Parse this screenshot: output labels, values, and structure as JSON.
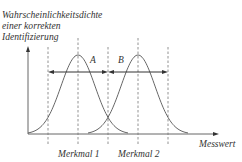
{
  "diagram": {
    "y_axis_label_lines": [
      "Wahrscheinlichkeitsdichte",
      "einer korrekten",
      "Identifizierung"
    ],
    "x_axis_label": "Messwert",
    "features": [
      {
        "label": "Merkmal 1"
      },
      {
        "label": "Merkmal 2"
      }
    ],
    "ranges": [
      {
        "label": "A"
      },
      {
        "label": "B"
      }
    ],
    "colors": {
      "line": "#555555",
      "text": "#333333"
    }
  }
}
